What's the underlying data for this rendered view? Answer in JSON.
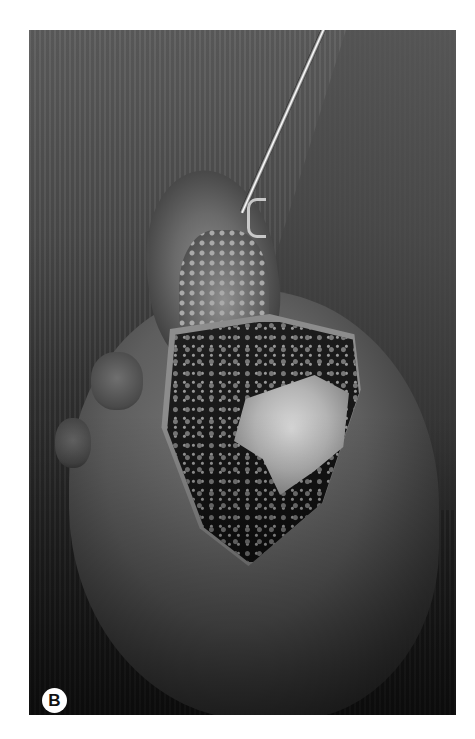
{
  "figure": {
    "panel_label": "B",
    "colors": {
      "background": "#ffffff",
      "photo_dark": "#1a1a1a",
      "photo_mid": "#5c5c5c",
      "bone_highlight": "#d8d8d8",
      "label_circle": "#ffffff",
      "label_text": "#111111"
    }
  }
}
